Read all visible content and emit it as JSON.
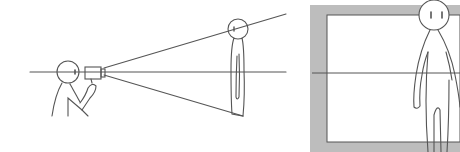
{
  "diagram": {
    "left_panel": {
      "elements": [
        "camera-operator",
        "camcorder",
        "view-cone",
        "standing-subject",
        "eye-level-line"
      ]
    },
    "right_panel": {
      "elements": [
        "frame-border",
        "viewfinder-area",
        "standing-subject-closeup",
        "eye-level-line"
      ]
    },
    "colors": {
      "line": "#555555",
      "frame_gray": "#b8b8b8",
      "background": "#ffffff"
    }
  }
}
